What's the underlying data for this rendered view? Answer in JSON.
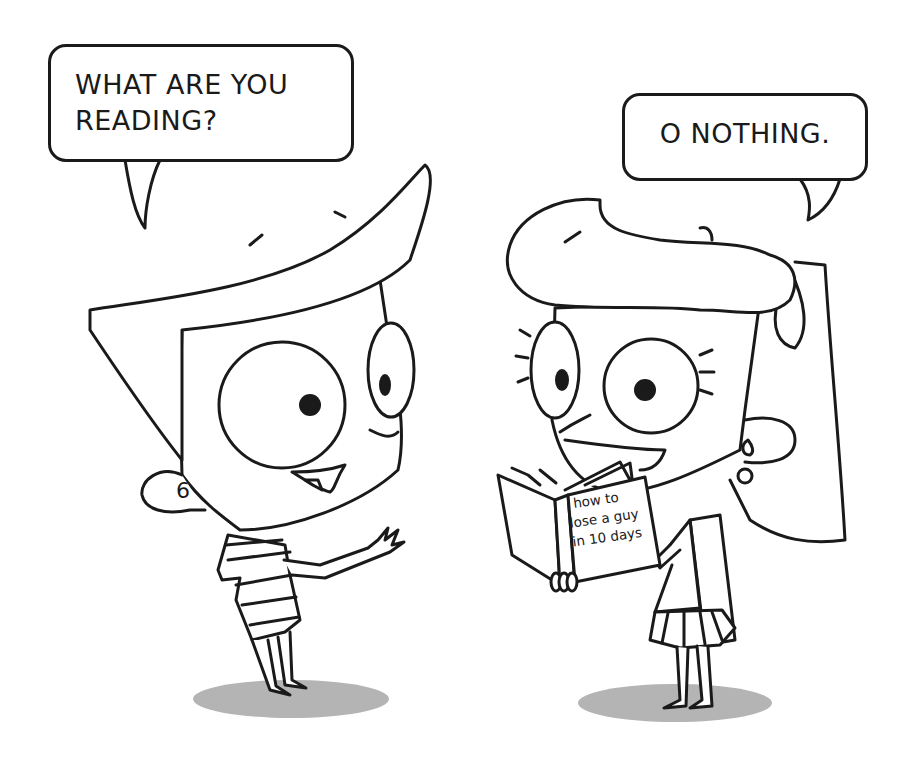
{
  "scene": {
    "description": "Two cartoon kids talking; girl holding a book",
    "background_color": "#ffffff",
    "line_color": "#1a1a1a",
    "shadow_color": "#b4b4b4"
  },
  "boy": {
    "speech_bubble": {
      "lines": [
        "WHAT ARE YOU",
        "READING?"
      ]
    }
  },
  "girl": {
    "speech_bubble": {
      "lines": [
        "O NOTHING."
      ]
    },
    "book": {
      "title_lines": [
        "how to",
        "lose a guy",
        "in 10 days"
      ]
    }
  }
}
